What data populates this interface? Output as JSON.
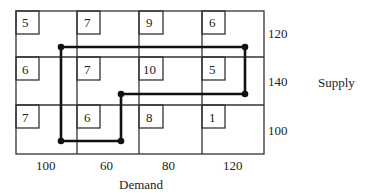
{
  "table": {
    "costs": [
      [
        5,
        7,
        9,
        6
      ],
      [
        6,
        7,
        10,
        5
      ],
      [
        7,
        6,
        8,
        1
      ]
    ],
    "supply": [
      120,
      140,
      100
    ],
    "demand": [
      100,
      60,
      80,
      120
    ],
    "supply_label": "Supply",
    "demand_label": "Demand"
  },
  "cells": {
    "r0c0": "5",
    "r0c1": "7",
    "r0c2": "9",
    "r0c3": "6",
    "r1c0": "6",
    "r1c1": "7",
    "r1c2": "10",
    "r1c3": "5",
    "r2c0": "7",
    "r2c1": "6",
    "r2c2": "8",
    "r2c3": "1"
  },
  "supply_values": [
    "120",
    "140",
    "100"
  ],
  "demand_values": [
    "100",
    "60",
    "80",
    "120"
  ],
  "loop_path": {
    "description": "Closed stepping-stone loop through cells",
    "points": [
      [
        0,
        0
      ],
      [
        0,
        3
      ],
      [
        1,
        3
      ],
      [
        1,
        1
      ],
      [
        2,
        1
      ],
      [
        2,
        0
      ]
    ]
  }
}
